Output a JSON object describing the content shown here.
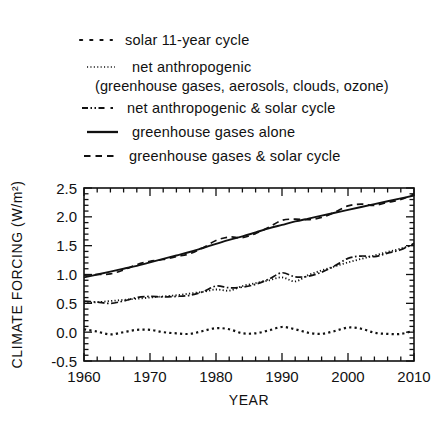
{
  "legend": {
    "items": [
      {
        "style": "dotted-coarse",
        "label": "solar 11-year cycle",
        "sublabel": ""
      },
      {
        "style": "dotted-fine",
        "label": "net anthropogenic",
        "sublabel": "(greenhouse gases, aerosols, clouds, ozone)"
      },
      {
        "style": "dash-dot",
        "label": "net anthropogenic & solar cycle",
        "sublabel": ""
      },
      {
        "style": "solid",
        "label": "greenhouse gases alone",
        "sublabel": ""
      },
      {
        "style": "dashed",
        "label": "greenhouse gases & solar cycle",
        "sublabel": ""
      }
    ]
  },
  "chart_data": {
    "type": "line",
    "title": "",
    "xlabel": "YEAR",
    "ylabel": "CLIMATE FORCING (W/m²)",
    "xlim": [
      1960,
      2010
    ],
    "ylim": [
      -0.5,
      2.5
    ],
    "xticks": [
      1960,
      1970,
      1980,
      1990,
      2000,
      2010
    ],
    "xtick_labels": [
      "1960",
      "1970",
      "1980",
      "1990",
      "2000",
      "2010"
    ],
    "yticks": [
      -0.5,
      0.0,
      0.5,
      1.0,
      1.5,
      2.0,
      2.5
    ],
    "ytick_labels": [
      "-0.5",
      "0.0",
      "0.5",
      "1.0",
      "1.5",
      "2.0",
      "2.5"
    ],
    "x_minor_step": 2,
    "y_minor_step": 0.1,
    "grid": false,
    "legend_position": "above-plot",
    "series": [
      {
        "name": "greenhouse gases alone",
        "style": "solid",
        "x": [
          1960,
          1962,
          1964,
          1966,
          1968,
          1970,
          1972,
          1974,
          1976,
          1978,
          1980,
          1982,
          1984,
          1986,
          1988,
          1990,
          1992,
          1994,
          1996,
          1998,
          2000,
          2002,
          2004,
          2006,
          2008,
          2010
        ],
        "values": [
          0.95,
          1.0,
          1.05,
          1.1,
          1.15,
          1.21,
          1.27,
          1.33,
          1.39,
          1.46,
          1.53,
          1.6,
          1.66,
          1.73,
          1.8,
          1.86,
          1.92,
          1.97,
          2.02,
          2.07,
          2.12,
          2.17,
          2.22,
          2.27,
          2.32,
          2.37
        ]
      },
      {
        "name": "greenhouse gases & solar cycle",
        "style": "dashed",
        "x": [
          1960,
          1962,
          1964,
          1966,
          1968,
          1970,
          1972,
          1974,
          1976,
          1978,
          1980,
          1982,
          1984,
          1986,
          1988,
          1990,
          1992,
          1994,
          1996,
          1998,
          2000,
          2002,
          2004,
          2006,
          2008,
          2010
        ],
        "values": [
          0.99,
          1.0,
          1.01,
          1.08,
          1.17,
          1.23,
          1.26,
          1.31,
          1.36,
          1.46,
          1.59,
          1.65,
          1.64,
          1.71,
          1.82,
          1.94,
          1.96,
          1.95,
          1.99,
          2.08,
          2.19,
          2.22,
          2.2,
          2.25,
          2.3,
          2.39
        ]
      },
      {
        "name": "net anthropogenic",
        "style": "dotted-fine",
        "x": [
          1960,
          1962,
          1964,
          1966,
          1968,
          1970,
          1972,
          1974,
          1976,
          1978,
          1980,
          1982,
          1984,
          1986,
          1988,
          1990,
          1992,
          1994,
          1996,
          1998,
          2000,
          2002,
          2004,
          2006,
          2008,
          2010
        ],
        "values": [
          0.5,
          0.52,
          0.54,
          0.56,
          0.58,
          0.6,
          0.62,
          0.64,
          0.67,
          0.7,
          0.74,
          0.72,
          0.8,
          0.85,
          0.9,
          0.95,
          0.88,
          0.99,
          1.07,
          1.14,
          1.21,
          1.27,
          1.33,
          1.39,
          1.45,
          1.52
        ]
      },
      {
        "name": "net anthropogenic & solar cycle",
        "style": "dash-dot",
        "x": [
          1960,
          1962,
          1964,
          1966,
          1968,
          1970,
          1972,
          1974,
          1976,
          1978,
          1980,
          1982,
          1984,
          1986,
          1988,
          1990,
          1992,
          1994,
          1996,
          1998,
          2000,
          2002,
          2004,
          2006,
          2008,
          2010
        ],
        "values": [
          0.54,
          0.52,
          0.5,
          0.54,
          0.6,
          0.62,
          0.61,
          0.62,
          0.64,
          0.7,
          0.8,
          0.77,
          0.78,
          0.83,
          0.92,
          1.03,
          0.96,
          0.97,
          1.04,
          1.15,
          1.28,
          1.32,
          1.31,
          1.37,
          1.43,
          1.54
        ]
      },
      {
        "name": "solar 11-year cycle",
        "style": "dotted-coarse",
        "x": [
          1960,
          1962,
          1964,
          1966,
          1968,
          1970,
          1972,
          1974,
          1976,
          1978,
          1980,
          1982,
          1984,
          1986,
          1988,
          1990,
          1992,
          1994,
          1996,
          1998,
          2000,
          2002,
          2004,
          2006,
          2008,
          2010
        ],
        "values": [
          0.05,
          0.01,
          -0.04,
          0.0,
          0.04,
          0.04,
          0.0,
          -0.02,
          -0.03,
          0.02,
          0.07,
          0.05,
          -0.02,
          -0.02,
          0.03,
          0.09,
          0.05,
          -0.01,
          -0.03,
          0.02,
          0.08,
          0.06,
          -0.01,
          -0.03,
          -0.03,
          0.03
        ]
      }
    ]
  }
}
